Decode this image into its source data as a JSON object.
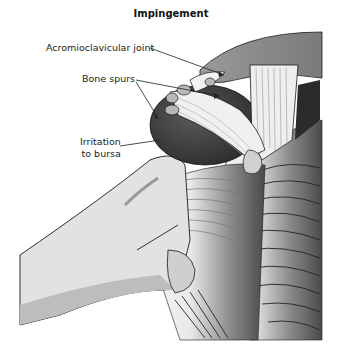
{
  "figure": {
    "title": "Impingement",
    "labels": [
      {
        "id": "acromioclavicular-joint",
        "text": "Acromioclavicular joint"
      },
      {
        "id": "bone-spurs",
        "text": "Bone spurs"
      },
      {
        "id": "irritation-to-bursa",
        "line1": "Irritation",
        "line2": "to bursa"
      }
    ],
    "palette": {
      "background": "#ffffff",
      "bone_light": "#e2e2e2",
      "bone_mid": "#bdbdbd",
      "dark_tissue": "#3a3a3a",
      "muscle_dark": "#555555",
      "outline": "#1a1a1a"
    }
  }
}
